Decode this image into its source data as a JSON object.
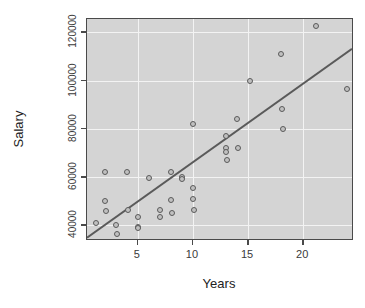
{
  "chart_data": {
    "type": "scatter",
    "title": "",
    "xlabel": "Years",
    "ylabel": "Salary",
    "xlim": [
      0.4,
      24.6
    ],
    "ylim": [
      33500,
      125500
    ],
    "xticks": [
      5,
      10,
      15,
      20
    ],
    "yticks": [
      40000,
      60000,
      80000,
      100000,
      120000
    ],
    "xticklabels": [
      "5",
      "10",
      "15",
      "20"
    ],
    "yticklabels": [
      "40000",
      "60000",
      "80000",
      "100000",
      "120000"
    ],
    "grid": true,
    "grid_color": "#f3f3f3",
    "panel_background": "#d4d4d4",
    "point_color": "#5a5a5a",
    "point_fill": "#c0c0c0",
    "legend": null,
    "points": [
      {
        "x": 1.2,
        "y": 41000
      },
      {
        "x": 2.0,
        "y": 62000
      },
      {
        "x": 2.0,
        "y": 50000
      },
      {
        "x": 2.1,
        "y": 46000
      },
      {
        "x": 3.0,
        "y": 40000
      },
      {
        "x": 3.1,
        "y": 36500
      },
      {
        "x": 4.0,
        "y": 62000
      },
      {
        "x": 4.1,
        "y": 46500
      },
      {
        "x": 5.0,
        "y": 43500
      },
      {
        "x": 5.0,
        "y": 39500
      },
      {
        "x": 5.05,
        "y": 39000
      },
      {
        "x": 6.0,
        "y": 59500
      },
      {
        "x": 7.0,
        "y": 46500
      },
      {
        "x": 7.0,
        "y": 43500
      },
      {
        "x": 8.0,
        "y": 62000
      },
      {
        "x": 8.0,
        "y": 50500
      },
      {
        "x": 8.1,
        "y": 45000
      },
      {
        "x": 9.0,
        "y": 60000
      },
      {
        "x": 9.0,
        "y": 59000
      },
      {
        "x": 10.0,
        "y": 82000
      },
      {
        "x": 10.0,
        "y": 55500
      },
      {
        "x": 10.0,
        "y": 51000
      },
      {
        "x": 10.1,
        "y": 46500
      },
      {
        "x": 13.0,
        "y": 77000
      },
      {
        "x": 13.0,
        "y": 72000
      },
      {
        "x": 13.0,
        "y": 70500
      },
      {
        "x": 13.1,
        "y": 67000
      },
      {
        "x": 14.0,
        "y": 84000
      },
      {
        "x": 14.1,
        "y": 72000
      },
      {
        "x": 15.2,
        "y": 100000
      },
      {
        "x": 18.0,
        "y": 111000
      },
      {
        "x": 18.1,
        "y": 88000
      },
      {
        "x": 18.2,
        "y": 80000
      },
      {
        "x": 21.2,
        "y": 122500
      },
      {
        "x": 24.0,
        "y": 96500
      }
    ],
    "fit_line": {
      "kind": "linear-regression",
      "x_start": 0.4,
      "y_start": 34000,
      "x_end": 24.6,
      "y_end": 113000,
      "color": "#5a5a5a",
      "width": 2
    }
  },
  "axis": {
    "y_title": "Salary",
    "x_title": "Years"
  }
}
